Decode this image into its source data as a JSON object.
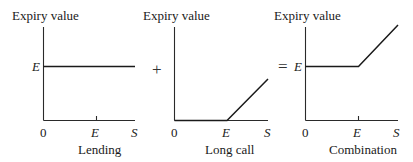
{
  "figure": {
    "operators": {
      "plus": "+",
      "equals": "="
    },
    "panels": [
      {
        "id": "lending",
        "title": "Lending",
        "ylabel": "Expiry value",
        "xlabel": "S",
        "origin": "0",
        "x_tick": "E",
        "y_tick": "E",
        "payoff": "constant at E"
      },
      {
        "id": "long-call",
        "title": "Long call",
        "ylabel": "Expiry value",
        "xlabel": "S",
        "origin": "0",
        "x_tick": "E",
        "y_tick": "",
        "payoff": "zero until E, then rising with slope 1"
      },
      {
        "id": "combination",
        "title": "Combination",
        "ylabel": "Expiry value",
        "xlabel": "S",
        "origin": "0",
        "x_tick": "E",
        "y_tick": "E",
        "payoff": "constant at E until S=E, then rising with slope 1"
      }
    ]
  },
  "colors": {
    "line": "#1a1a1a",
    "axis": "#2a2a2a",
    "background": "#ffffff"
  }
}
